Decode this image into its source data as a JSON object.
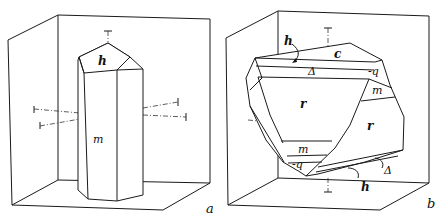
{
  "figure": {
    "panels": [
      {
        "id": "a",
        "caption": "a",
        "description": "Prismatic crystal with hexagonal prism and pyramid termination",
        "face_labels": {
          "top": "h",
          "prism": "m"
        }
      },
      {
        "id": "b",
        "caption": "b",
        "description": "Irregular crystal with multiple labelled faces",
        "face_labels": {
          "c": "c",
          "h_top": "h",
          "delta_top": "Δ",
          "q_top": "-q",
          "m_right": "m",
          "r_left": "r",
          "r_right": "r",
          "m_bottom": "m",
          "q_bottom": "-q",
          "delta_bottom": "Δ",
          "h_bottom": "h"
        }
      }
    ]
  }
}
